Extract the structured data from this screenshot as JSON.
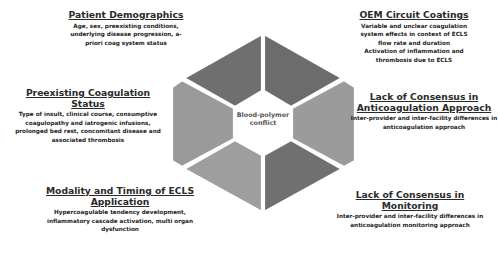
{
  "diagram": {
    "center": {
      "label": "Blood-polymer conflict"
    },
    "segments": [
      {
        "position": "top-left",
        "color": "#6f6f6f"
      },
      {
        "position": "top-right",
        "color": "#6c6c6c"
      },
      {
        "position": "right",
        "color": "#9b9b9b"
      },
      {
        "position": "bottom-right",
        "color": "#707070"
      },
      {
        "position": "bottom-left",
        "color": "#9e9e9e"
      },
      {
        "position": "left",
        "color": "#9a9a9a"
      }
    ],
    "blocks": {
      "patient": {
        "title": "Patient Demographics",
        "desc": "Age, sex, preexisting conditions, underlying disease progression, a-priori coag system status"
      },
      "oem": {
        "title": "OEM Circuit Coatings",
        "lines": [
          "Variable and unclear coagulation",
          "system effects in context of ECLS",
          "flow rate and duration",
          "Activation of inflammation and",
          "thrombosis due to ECLS"
        ]
      },
      "preexisting": {
        "title": "Preexisting Coagulation Status",
        "desc": "Type of insult, clinical course, consumptive coagulopathy and iatrogenic infusions, prolonged bed rest, concomitant disease and associated thrombosis"
      },
      "lack_anti": {
        "title": "Lack of Consensus in Anticoagulation Approach",
        "desc": "Inter-provider and inter-facility differences in anticoagulation approach"
      },
      "modality": {
        "title": "Modality and Timing of ECLS Application",
        "desc": "Hypercoagulable tendency development, inflammatory cascade activation, multi organ dysfunction"
      },
      "lack_mon": {
        "title": "Lack of Consensus in Monitoring",
        "desc": "Inter-provider and inter-facility differences in anticoagulation monitoring approach"
      }
    }
  }
}
